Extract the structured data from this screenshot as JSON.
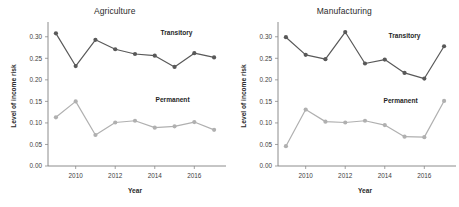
{
  "figure": {
    "background_color": "#ffffff",
    "panel_count": 2
  },
  "colors": {
    "transitory": "#595959",
    "permanent": "#b0b0b0",
    "axis": "#6e6e6e",
    "text": "#2b2b2b"
  },
  "chart_data": [
    {
      "type": "line",
      "title": "Agriculture",
      "xlabel": "Year",
      "ylabel": "Level of income risk",
      "x": [
        2009,
        2010,
        2011,
        2012,
        2013,
        2014,
        2015,
        2016,
        2017
      ],
      "xlim": [
        2008.6,
        2017.4
      ],
      "ylim": [
        0.0,
        0.325
      ],
      "xticks": [
        2010,
        2012,
        2014,
        2016
      ],
      "xticklabels": [
        "2010",
        "2012",
        "2014",
        "2016"
      ],
      "yticks": [
        0.0,
        0.05,
        0.1,
        0.15,
        0.2,
        0.25,
        0.3
      ],
      "yticklabels": [
        "0.00",
        "0.05",
        "0.10",
        "0.15",
        "0.20",
        "0.25",
        "0.30"
      ],
      "grid": false,
      "legend_position": "inline-annotation",
      "series": [
        {
          "name": "Transitory",
          "color": "#595959",
          "values": [
            0.308,
            0.232,
            0.293,
            0.271,
            0.26,
            0.256,
            0.23,
            0.262,
            0.252
          ],
          "label_x": 2015.1,
          "label_y": 0.305
        },
        {
          "name": "Permanent",
          "color": "#b0b0b0",
          "values": [
            0.113,
            0.15,
            0.072,
            0.101,
            0.105,
            0.089,
            0.092,
            0.102,
            0.084
          ],
          "label_x": 2014.9,
          "label_y": 0.148
        }
      ]
    },
    {
      "type": "line",
      "title": "Manufacturing",
      "xlabel": "Year",
      "ylabel": "Level of income risk",
      "x": [
        2009,
        2010,
        2011,
        2012,
        2013,
        2014,
        2015,
        2016,
        2017
      ],
      "xlim": [
        2008.6,
        2017.4
      ],
      "ylim": [
        0.0,
        0.325
      ],
      "xticks": [
        2010,
        2012,
        2014,
        2016
      ],
      "xticklabels": [
        "2010",
        "2012",
        "2014",
        "2016"
      ],
      "yticks": [
        0.0,
        0.05,
        0.1,
        0.15,
        0.2,
        0.25,
        0.3
      ],
      "yticklabels": [
        "0.00",
        "0.05",
        "0.10",
        "0.15",
        "0.20",
        "0.25",
        "0.30"
      ],
      "grid": false,
      "legend_position": "inline-annotation",
      "series": [
        {
          "name": "Transitory",
          "color": "#595959",
          "values": [
            0.299,
            0.258,
            0.248,
            0.311,
            0.238,
            0.247,
            0.216,
            0.203,
            0.278
          ],
          "label_x": 2015.0,
          "label_y": 0.296
        },
        {
          "name": "Permanent",
          "color": "#b0b0b0",
          "values": [
            0.046,
            0.131,
            0.103,
            0.101,
            0.105,
            0.095,
            0.068,
            0.067,
            0.151
          ],
          "label_x": 2014.8,
          "label_y": 0.146
        }
      ]
    }
  ]
}
